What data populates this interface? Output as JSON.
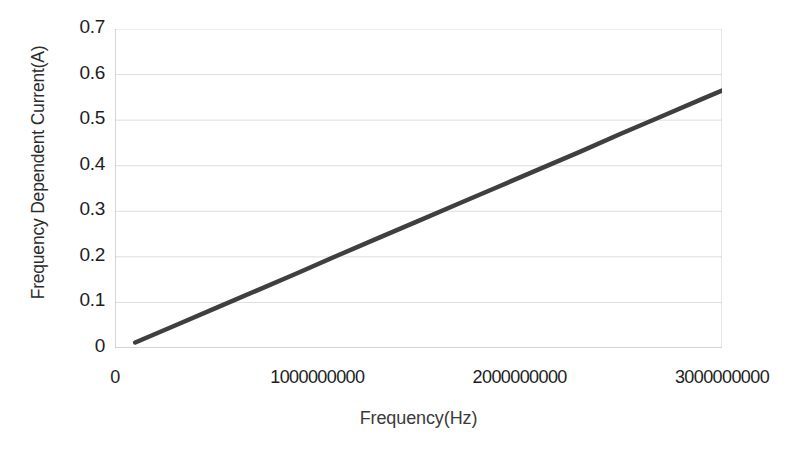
{
  "figure": {
    "title_remnant": "",
    "background_color": "#ffffff"
  },
  "axes": {
    "y_title": "Frequency Dependent Current(A)",
    "x_title": "Frequency(Hz)",
    "y_tick_labels": [
      "0.7",
      "0.6",
      "0.5",
      "0.4",
      "0.3",
      "0.2",
      "0.1",
      "0"
    ],
    "x_tick_labels": [
      "0",
      "1000000000",
      "2000000000",
      "3000000000"
    ]
  },
  "chart_data": {
    "type": "line",
    "title": "",
    "xlabel": "Frequency(Hz)",
    "ylabel": "Frequency Dependent Current(A)",
    "xlim": [
      0,
      3000000000
    ],
    "ylim": [
      0,
      0.7
    ],
    "xticks": [
      0,
      1000000000,
      2000000000,
      3000000000
    ],
    "xticklabels": [
      "0",
      "1000000000",
      "2000000000",
      "3000000000"
    ],
    "yticks": [
      0,
      0.1,
      0.2,
      0.3,
      0.4,
      0.5,
      0.6,
      0.7
    ],
    "yticklabels": [
      "0",
      "0.1",
      "0.2",
      "0.3",
      "0.4",
      "0.5",
      "0.6",
      "0.7"
    ],
    "grid": "horizontal",
    "legend": "none",
    "series": [
      {
        "name": "Frequency Dependent Current",
        "color": "#3f3f3f",
        "line_width": 4.5,
        "x": [
          100000000,
          300000000,
          500000000,
          700000000,
          900000000,
          1100000000,
          1300000000,
          1500000000,
          1700000000,
          1900000000,
          2100000000,
          2300000000,
          2500000000,
          2700000000,
          2900000000,
          3000000000
        ],
        "y": [
          0.012,
          0.05,
          0.088,
          0.126,
          0.164,
          0.203,
          0.241,
          0.279,
          0.317,
          0.355,
          0.393,
          0.431,
          0.47,
          0.508,
          0.546,
          0.565
        ]
      }
    ]
  }
}
